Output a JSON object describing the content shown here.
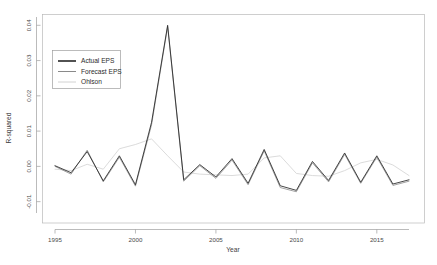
{
  "chart_data": {
    "type": "line",
    "title": "",
    "xlabel": "Year",
    "ylabel": "R-squared",
    "xlim": [
      1994.2,
      2017.4
    ],
    "ylim": [
      -0.0135,
      0.0415
    ],
    "xticks": [
      1995,
      2000,
      2005,
      2010,
      2015
    ],
    "xtick_labels": [
      "1995",
      "2000",
      "2005",
      "2010",
      "2015"
    ],
    "yticks": [
      -0.01,
      0.0,
      0.01,
      0.02,
      0.03,
      0.04
    ],
    "ytick_labels": [
      "-0.01",
      "0.00",
      "0.01",
      "0.02",
      "0.03",
      "0.04"
    ],
    "grid": false,
    "legend_position": "upper-left",
    "x": [
      1995,
      1996,
      1997,
      1998,
      1999,
      2000,
      2001,
      2002,
      2003,
      2004,
      2005,
      2006,
      2007,
      2008,
      2009,
      2010,
      2011,
      2012,
      2013,
      2014,
      2015,
      2016,
      2017
    ],
    "series": [
      {
        "name": "Actual EPS",
        "color": "#262626",
        "width": 0.85,
        "values": [
          0.0002,
          -0.0018,
          0.0042,
          -0.0041,
          0.003,
          -0.0052,
          0.0125,
          0.04,
          -0.0038,
          0.0005,
          -0.003,
          0.0022,
          -0.0048,
          0.0048,
          -0.0055,
          -0.0068,
          0.0014,
          -0.004,
          0.0038,
          -0.0045,
          0.003,
          -0.005,
          -0.0038
        ]
      },
      {
        "name": "Forecast EPS",
        "color": "#8a8a8a",
        "width": 0.8,
        "values": [
          0.0,
          -0.0022,
          0.0046,
          -0.0044,
          0.0026,
          -0.0056,
          0.0118,
          0.0396,
          -0.0042,
          0.0002,
          -0.0034,
          0.0018,
          -0.0052,
          0.0044,
          -0.006,
          -0.0072,
          0.001,
          -0.0044,
          0.0034,
          -0.0048,
          0.0026,
          -0.0054,
          -0.0042
        ]
      },
      {
        "name": "Ohlson",
        "color": "#d2d2d2",
        "width": 0.8,
        "values": [
          -0.0008,
          -0.0012,
          0.0006,
          -0.0008,
          0.005,
          0.0062,
          0.0078,
          0.003,
          -0.0016,
          -0.0022,
          -0.0024,
          -0.0026,
          -0.0022,
          0.0024,
          0.003,
          -0.002,
          -0.0026,
          -0.0028,
          -0.0012,
          0.001,
          0.002,
          0.0004,
          -0.0026
        ]
      }
    ],
    "legend_entries": [
      {
        "label": "Actual EPS",
        "color": "#262626",
        "width": 1.6
      },
      {
        "label": "Forecast EPS",
        "color": "#8a8a8a",
        "width": 1.0
      },
      {
        "label": "Ohlson",
        "color": "#d2d2d2",
        "width": 1.0
      }
    ]
  }
}
